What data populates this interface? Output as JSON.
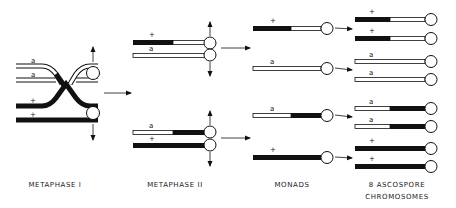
{
  "stages": [
    {
      "id": "metaphase-1",
      "label": "METAPHASE I"
    },
    {
      "id": "metaphase-2",
      "label": "METAPHASE II"
    },
    {
      "id": "monads",
      "label": "MONADS"
    },
    {
      "id": "ascospores",
      "label": "8 ASCOSPORE\nCHROMOSOMES"
    }
  ],
  "alleles": {
    "wild_type": "+",
    "mutant": "a"
  },
  "colors": {
    "wild_type_segment": "#111111",
    "mutant_segment": "#ffffff",
    "outline": "#111111"
  },
  "metaphase_1": {
    "chromatids": [
      {
        "allele": "a",
        "segments": "white"
      },
      {
        "allele": "a",
        "segments": "white-crossover"
      },
      {
        "allele": "+",
        "segments": "black-crossover"
      },
      {
        "allele": "+",
        "segments": "black"
      }
    ]
  },
  "metaphase_2": {
    "top_dyad": [
      {
        "allele": "+",
        "left": "black",
        "right": "white"
      },
      {
        "allele": "a",
        "left": "white",
        "right": "white"
      }
    ],
    "bottom_dyad": [
      {
        "allele": "a",
        "left": "white",
        "right": "black"
      },
      {
        "allele": "+",
        "left": "black",
        "right": "black"
      }
    ]
  },
  "monads": [
    {
      "allele": "+",
      "left": "black",
      "right": "white"
    },
    {
      "allele": "a",
      "left": "white",
      "right": "white"
    },
    {
      "allele": "a",
      "left": "white",
      "right": "black"
    },
    {
      "allele": "+",
      "left": "black",
      "right": "black"
    }
  ],
  "ascospore_chromosomes": [
    {
      "allele": "+",
      "left": "black",
      "right": "white"
    },
    {
      "allele": "+",
      "left": "black",
      "right": "white"
    },
    {
      "allele": "a",
      "left": "white",
      "right": "white"
    },
    {
      "allele": "a",
      "left": "white",
      "right": "white"
    },
    {
      "allele": "a",
      "left": "white",
      "right": "black"
    },
    {
      "allele": "a",
      "left": "white",
      "right": "black"
    },
    {
      "allele": "+",
      "left": "black",
      "right": "black"
    },
    {
      "allele": "+",
      "left": "black",
      "right": "black"
    }
  ]
}
